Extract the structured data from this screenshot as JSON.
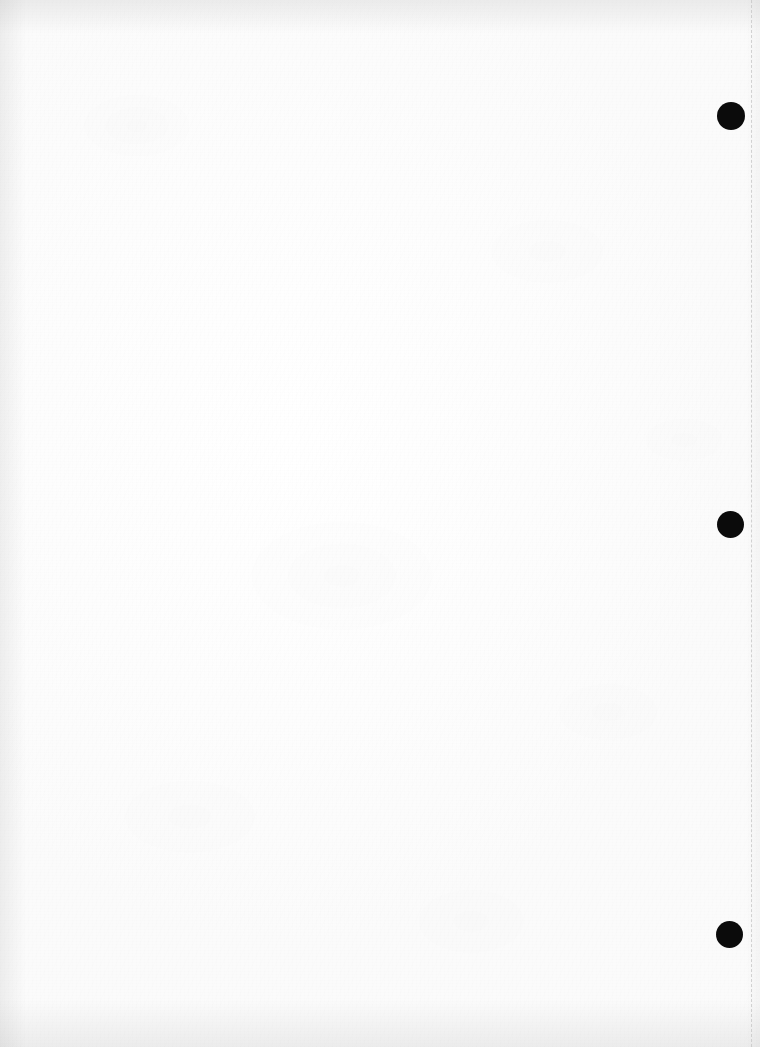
{
  "page": {
    "width": 760,
    "height": 1047,
    "background_color": "#fdfdfd",
    "content_text": ""
  },
  "perforation": {
    "name": "vertical-dashed-line",
    "color": "#c9c9c9",
    "x": 751,
    "orientation": "vertical",
    "style": "dashed",
    "width_px": 1
  },
  "punch_marks": {
    "color": "#0b0b0b",
    "shape": "circle",
    "count": 3,
    "items": [
      {
        "label": "top",
        "cx": 731,
        "cy": 116,
        "diameter": 28
      },
      {
        "label": "middle",
        "cx": 730,
        "cy": 524,
        "diameter": 27
      },
      {
        "label": "bottom",
        "cx": 729,
        "cy": 934,
        "diameter": 27
      }
    ]
  },
  "edges": {
    "top_shadow_color": "#969696",
    "bottom_shadow_color": "#969696",
    "left_shadow_color": "#969696",
    "right_shadow_color": "#969696"
  }
}
